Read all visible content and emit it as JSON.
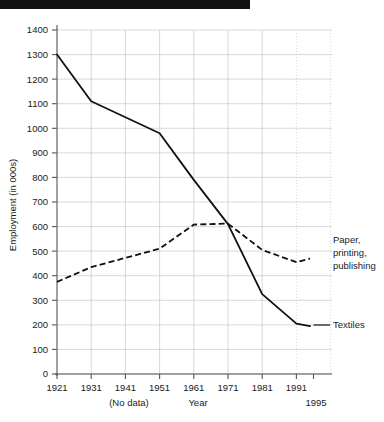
{
  "decoration": {
    "top_bar_name": "black-redaction-bar"
  },
  "chart_data": {
    "type": "line",
    "title": "",
    "xlabel": "Year",
    "ylabel": "Employment (in 000s)",
    "x": [
      1921,
      1931,
      1941,
      1951,
      1961,
      1971,
      1981,
      1991,
      1995
    ],
    "categories": [
      "1921",
      "1931",
      "1941",
      "1951",
      "1961",
      "1971",
      "1981",
      "1991",
      "1995"
    ],
    "xtick_labels": [
      "1921",
      "1931",
      "1941",
      "1951",
      "1961",
      "1971",
      "1981",
      "1991"
    ],
    "extra_xtick_label": "1995",
    "ytick_labels": [
      "0",
      "100",
      "200",
      "300",
      "400",
      "500",
      "600",
      "700",
      "800",
      "900",
      "1000",
      "1100",
      "1200",
      "1300",
      "1400"
    ],
    "yticks": [
      0,
      100,
      200,
      300,
      400,
      500,
      600,
      700,
      800,
      900,
      1000,
      1100,
      1200,
      1300,
      1400
    ],
    "ylim": [
      0,
      1400
    ],
    "xlim": [
      1921,
      1997
    ],
    "grid": true,
    "legend_position": "inline-right-labels",
    "annotations": [
      {
        "text": "(No data)",
        "x": 1941,
        "note": "below x-axis tick for 1941"
      },
      {
        "text": "Year",
        "x": 1961,
        "note": "x axis title placed below 1961 tick"
      }
    ],
    "series": [
      {
        "name": "Textiles",
        "style": "solid",
        "color": "#111111",
        "label": "Textiles",
        "x": [
          1921,
          1931,
          1941,
          1951,
          1961,
          1971,
          1981,
          1991,
          1995
        ],
        "values": [
          1300,
          1110,
          null,
          980,
          790,
          610,
          325,
          205,
          195
        ]
      },
      {
        "name": "Paper, printing, publishing",
        "style": "dashed",
        "color": "#111111",
        "label": "Paper,\nprinting,\npublishing",
        "label_lines": [
          "Paper,",
          "printing,",
          "publishing"
        ],
        "x": [
          1921,
          1931,
          1941,
          1951,
          1961,
          1971,
          1981,
          1991,
          1995
        ],
        "values": [
          375,
          435,
          null,
          510,
          608,
          612,
          505,
          455,
          470
        ]
      }
    ]
  },
  "axis": {
    "y_title": "Employment (in 000s)",
    "x_title": "Year",
    "no_data_note": "(No data)",
    "extra_year": "1995"
  },
  "series_labels": {
    "paper_line1": "Paper,",
    "paper_line2": "printing,",
    "paper_line3": "publishing",
    "textiles": "Textiles"
  },
  "ytick_values": {
    "t0": "0",
    "t1": "100",
    "t2": "200",
    "t3": "300",
    "t4": "400",
    "t5": "500",
    "t6": "600",
    "t7": "700",
    "t8": "800",
    "t9": "900",
    "t10": "1000",
    "t11": "1100",
    "t12": "1200",
    "t13": "1300",
    "t14": "1400"
  },
  "xtick_values": {
    "x0": "1921",
    "x1": "1931",
    "x2": "1941",
    "x3": "1951",
    "x4": "1961",
    "x5": "1971",
    "x6": "1981",
    "x7": "1991"
  }
}
